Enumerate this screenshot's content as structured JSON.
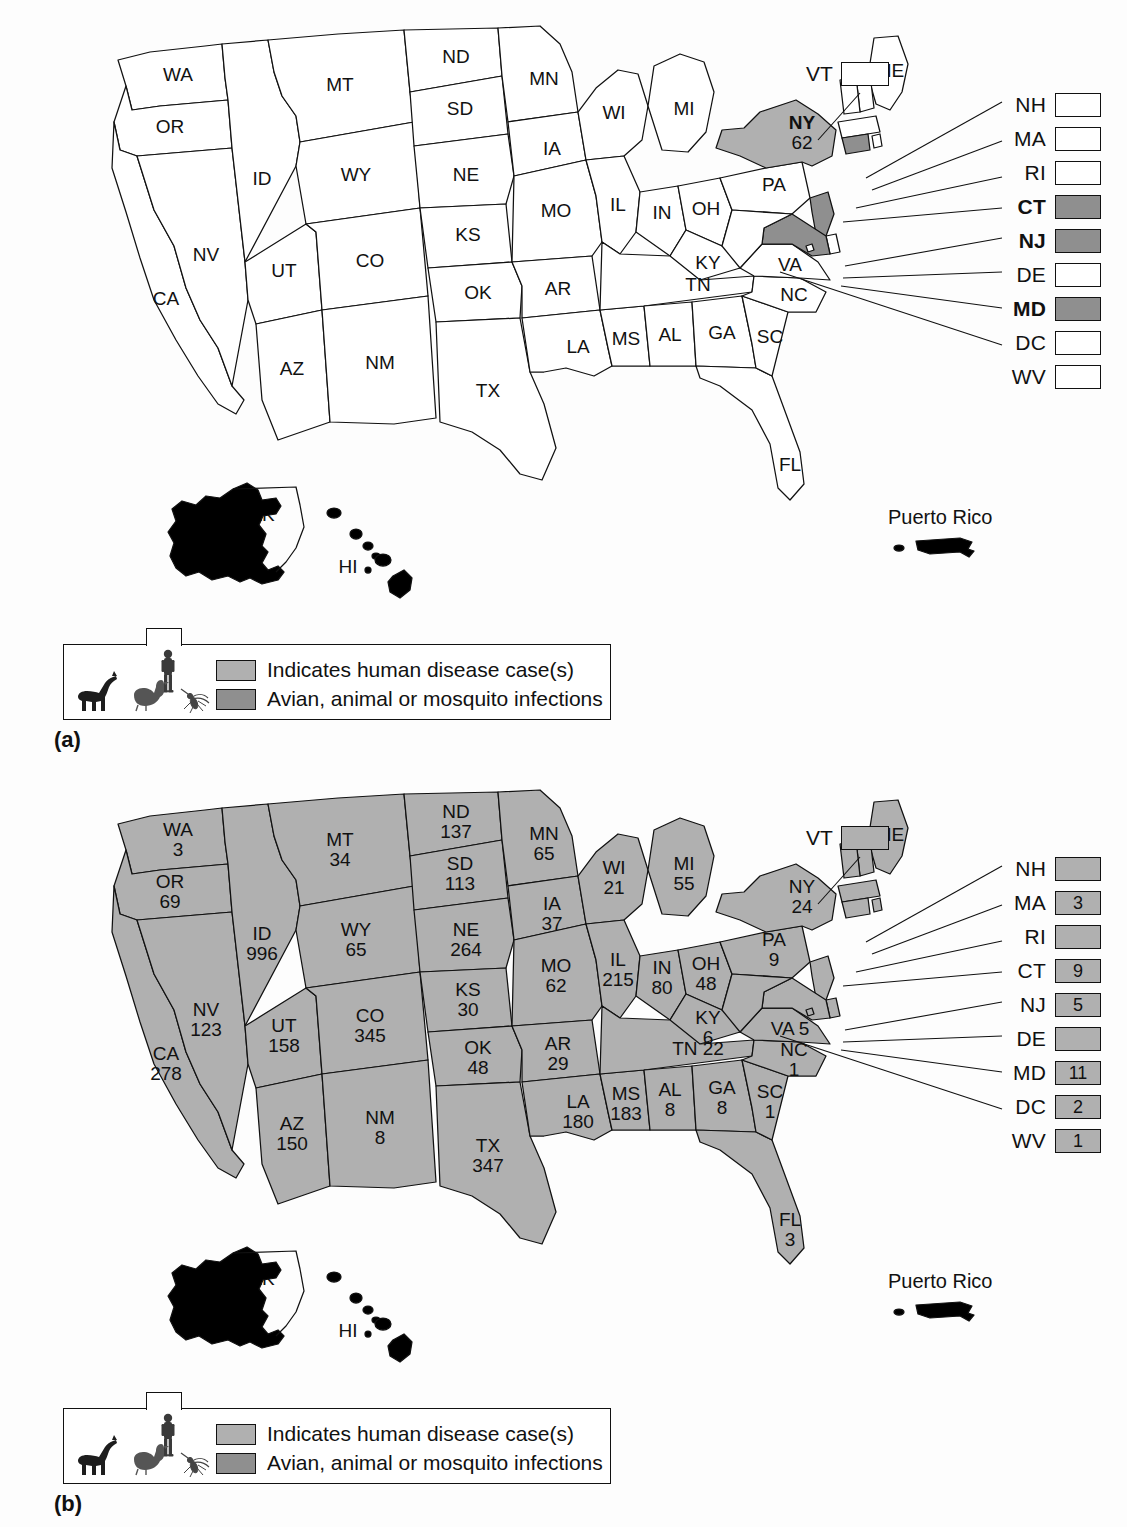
{
  "figure": {
    "panels": [
      {
        "tag": "(a)",
        "side_list_title": "",
        "puerto_rico_label": "Puerto Rico",
        "ak_label": "AK",
        "hi_label": "HI",
        "vt_callout": {
          "abbr": "VT",
          "value": "",
          "shaded": "none"
        },
        "side_list": [
          {
            "abbr": "NH",
            "value": "",
            "shaded": "none",
            "bold": false
          },
          {
            "abbr": "MA",
            "value": "",
            "shaded": "none",
            "bold": false
          },
          {
            "abbr": "RI",
            "value": "",
            "shaded": "none",
            "bold": false
          },
          {
            "abbr": "CT",
            "value": "",
            "shaded": "avian",
            "bold": true
          },
          {
            "abbr": "NJ",
            "value": "",
            "shaded": "avian",
            "bold": true
          },
          {
            "abbr": "DE",
            "value": "",
            "shaded": "none",
            "bold": false
          },
          {
            "abbr": "MD",
            "value": "",
            "shaded": "avian",
            "bold": true
          },
          {
            "abbr": "DC",
            "value": "",
            "shaded": "none",
            "bold": false
          },
          {
            "abbr": "WV",
            "value": "",
            "shaded": "none",
            "bold": false
          }
        ],
        "states": [
          {
            "abbr": "WA",
            "value": "",
            "shaded": "none"
          },
          {
            "abbr": "OR",
            "value": "",
            "shaded": "none"
          },
          {
            "abbr": "CA",
            "value": "",
            "shaded": "none"
          },
          {
            "abbr": "NV",
            "value": "",
            "shaded": "none"
          },
          {
            "abbr": "ID",
            "value": "",
            "shaded": "none"
          },
          {
            "abbr": "MT",
            "value": "",
            "shaded": "none"
          },
          {
            "abbr": "WY",
            "value": "",
            "shaded": "none"
          },
          {
            "abbr": "UT",
            "value": "",
            "shaded": "none"
          },
          {
            "abbr": "AZ",
            "value": "",
            "shaded": "none"
          },
          {
            "abbr": "CO",
            "value": "",
            "shaded": "none"
          },
          {
            "abbr": "NM",
            "value": "",
            "shaded": "none"
          },
          {
            "abbr": "ND",
            "value": "",
            "shaded": "none"
          },
          {
            "abbr": "SD",
            "value": "",
            "shaded": "none"
          },
          {
            "abbr": "NE",
            "value": "",
            "shaded": "none"
          },
          {
            "abbr": "KS",
            "value": "",
            "shaded": "none"
          },
          {
            "abbr": "OK",
            "value": "",
            "shaded": "none"
          },
          {
            "abbr": "TX",
            "value": "",
            "shaded": "none"
          },
          {
            "abbr": "MN",
            "value": "",
            "shaded": "none"
          },
          {
            "abbr": "IA",
            "value": "",
            "shaded": "none"
          },
          {
            "abbr": "MO",
            "value": "",
            "shaded": "none"
          },
          {
            "abbr": "AR",
            "value": "",
            "shaded": "none"
          },
          {
            "abbr": "LA",
            "value": "",
            "shaded": "none"
          },
          {
            "abbr": "WI",
            "value": "",
            "shaded": "none"
          },
          {
            "abbr": "IL",
            "value": "",
            "shaded": "none"
          },
          {
            "abbr": "MS",
            "value": "",
            "shaded": "none"
          },
          {
            "abbr": "MI",
            "value": "",
            "shaded": "none"
          },
          {
            "abbr": "IN",
            "value": "",
            "shaded": "none"
          },
          {
            "abbr": "OH",
            "value": "",
            "shaded": "none"
          },
          {
            "abbr": "KY",
            "value": "",
            "shaded": "none"
          },
          {
            "abbr": "TN",
            "value": "",
            "shaded": "none"
          },
          {
            "abbr": "AL",
            "value": "",
            "shaded": "none"
          },
          {
            "abbr": "GA",
            "value": "",
            "shaded": "none"
          },
          {
            "abbr": "FL",
            "value": "",
            "shaded": "none"
          },
          {
            "abbr": "SC",
            "value": "",
            "shaded": "none"
          },
          {
            "abbr": "NC",
            "value": "",
            "shaded": "none"
          },
          {
            "abbr": "VA",
            "value": "",
            "shaded": "none"
          },
          {
            "abbr": "PA",
            "value": "",
            "shaded": "none"
          },
          {
            "abbr": "NY",
            "value": "62",
            "shaded": "human"
          },
          {
            "abbr": "ME",
            "value": "",
            "shaded": "none"
          }
        ],
        "legend": {
          "human_label": "Indicates human disease case(s)",
          "avian_label": "Avian, animal or mosquito infections"
        }
      },
      {
        "tag": "(b)",
        "side_list_title": "",
        "puerto_rico_label": "Puerto Rico",
        "ak_label": "AK",
        "hi_label": "HI",
        "vt_callout": {
          "abbr": "VT",
          "value": "",
          "shaded": "human"
        },
        "side_list": [
          {
            "abbr": "NH",
            "value": "",
            "shaded": "human",
            "bold": false
          },
          {
            "abbr": "MA",
            "value": "3",
            "shaded": "human",
            "bold": false
          },
          {
            "abbr": "RI",
            "value": "",
            "shaded": "human",
            "bold": false
          },
          {
            "abbr": "CT",
            "value": "9",
            "shaded": "human",
            "bold": false
          },
          {
            "abbr": "NJ",
            "value": "5",
            "shaded": "human",
            "bold": false
          },
          {
            "abbr": "DE",
            "value": "",
            "shaded": "human",
            "bold": false
          },
          {
            "abbr": "MD",
            "value": "11",
            "shaded": "human",
            "bold": false
          },
          {
            "abbr": "DC",
            "value": "2",
            "shaded": "human",
            "bold": false
          },
          {
            "abbr": "WV",
            "value": "1",
            "shaded": "human",
            "bold": false
          }
        ],
        "states": [
          {
            "abbr": "WA",
            "value": "3",
            "shaded": "human"
          },
          {
            "abbr": "OR",
            "value": "69",
            "shaded": "human"
          },
          {
            "abbr": "CA",
            "value": "278",
            "shaded": "human"
          },
          {
            "abbr": "NV",
            "value": "123",
            "shaded": "human"
          },
          {
            "abbr": "ID",
            "value": "996",
            "shaded": "human"
          },
          {
            "abbr": "MT",
            "value": "34",
            "shaded": "human"
          },
          {
            "abbr": "WY",
            "value": "65",
            "shaded": "human"
          },
          {
            "abbr": "UT",
            "value": "158",
            "shaded": "human"
          },
          {
            "abbr": "AZ",
            "value": "150",
            "shaded": "human"
          },
          {
            "abbr": "CO",
            "value": "345",
            "shaded": "human"
          },
          {
            "abbr": "NM",
            "value": "8",
            "shaded": "human"
          },
          {
            "abbr": "ND",
            "value": "137",
            "shaded": "human"
          },
          {
            "abbr": "SD",
            "value": "113",
            "shaded": "human"
          },
          {
            "abbr": "NE",
            "value": "264",
            "shaded": "human"
          },
          {
            "abbr": "KS",
            "value": "30",
            "shaded": "human"
          },
          {
            "abbr": "OK",
            "value": "48",
            "shaded": "human"
          },
          {
            "abbr": "TX",
            "value": "347",
            "shaded": "human"
          },
          {
            "abbr": "MN",
            "value": "65",
            "shaded": "human"
          },
          {
            "abbr": "IA",
            "value": "37",
            "shaded": "human"
          },
          {
            "abbr": "MO",
            "value": "62",
            "shaded": "human"
          },
          {
            "abbr": "AR",
            "value": "29",
            "shaded": "human"
          },
          {
            "abbr": "LA",
            "value": "180",
            "shaded": "human"
          },
          {
            "abbr": "WI",
            "value": "21",
            "shaded": "human"
          },
          {
            "abbr": "IL",
            "value": "215",
            "shaded": "human"
          },
          {
            "abbr": "MS",
            "value": "183",
            "shaded": "human"
          },
          {
            "abbr": "MI",
            "value": "55",
            "shaded": "human"
          },
          {
            "abbr": "IN",
            "value": "80",
            "shaded": "human"
          },
          {
            "abbr": "OH",
            "value": "48",
            "shaded": "human"
          },
          {
            "abbr": "KY",
            "value": "6",
            "shaded": "human"
          },
          {
            "abbr": "TN",
            "value": "22",
            "shaded": "human"
          },
          {
            "abbr": "AL",
            "value": "8",
            "shaded": "human"
          },
          {
            "abbr": "GA",
            "value": "8",
            "shaded": "human"
          },
          {
            "abbr": "FL",
            "value": "3",
            "shaded": "human"
          },
          {
            "abbr": "SC",
            "value": "1",
            "shaded": "human"
          },
          {
            "abbr": "NC",
            "value": "1",
            "shaded": "human"
          },
          {
            "abbr": "VA",
            "value": "5",
            "shaded": "human"
          },
          {
            "abbr": "PA",
            "value": "9",
            "shaded": "human"
          },
          {
            "abbr": "NY",
            "value": "24",
            "shaded": "human"
          },
          {
            "abbr": "ME",
            "value": "",
            "shaded": "human"
          }
        ],
        "legend": {
          "human_label": "Indicates human disease case(s)",
          "avian_label": "Avian, animal or mosquito infections"
        }
      }
    ],
    "colors": {
      "human_fill": "#b0b0b0",
      "avian_fill": "#8f8f8f",
      "no_fill": "#ffffff",
      "outline": "#111111",
      "background": "#fdfdfd"
    }
  }
}
